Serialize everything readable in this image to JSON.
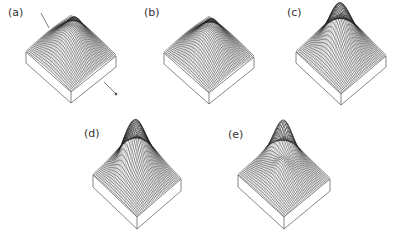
{
  "figure": {
    "panels": [
      {
        "id": "a",
        "label": "(a)",
        "label_pos": [
          8,
          6
        ],
        "center_x": 71,
        "top_y": 14,
        "half_width": 45,
        "depth": 38,
        "base_height": 11,
        "peaks": [
          [
            0.5,
            0.5,
            0.35,
            0.6
          ],
          [
            0.2,
            0.3,
            0.1,
            0.35
          ]
        ],
        "has_arrow": true
      },
      {
        "id": "b",
        "label": "(b)",
        "label_pos": [
          144,
          6
        ],
        "center_x": 209,
        "top_y": 15,
        "half_width": 45,
        "depth": 38,
        "base_height": 11,
        "peaks": [
          [
            0.5,
            0.5,
            0.35,
            0.6
          ],
          [
            0.22,
            0.3,
            0.1,
            0.3
          ]
        ],
        "has_arrow": false
      },
      {
        "id": "c",
        "label": "(c)",
        "label_pos": [
          287,
          6
        ],
        "center_x": 341,
        "top_y": 12,
        "half_width": 45,
        "depth": 40,
        "base_height": 11,
        "peaks": [
          [
            0.35,
            0.35,
            0.18,
            0.8
          ],
          [
            0.55,
            0.45,
            0.15,
            0.4
          ],
          [
            0.5,
            0.5,
            0.4,
            0.3
          ]
        ],
        "has_arrow": false
      },
      {
        "id": "d",
        "label": "(d)",
        "label_pos": [
          84,
          127
        ],
        "center_x": 137,
        "top_y": 135,
        "half_width": 44,
        "depth": 40,
        "base_height": 12,
        "peaks": [
          [
            0.3,
            0.3,
            0.2,
            0.9
          ],
          [
            0.45,
            0.45,
            0.12,
            0.5
          ],
          [
            0.6,
            0.35,
            0.1,
            0.45
          ],
          [
            0.5,
            0.5,
            0.4,
            0.3
          ]
        ],
        "has_arrow": false
      },
      {
        "id": "e",
        "label": "(e)",
        "label_pos": [
          228,
          128
        ],
        "center_x": 284,
        "top_y": 135,
        "half_width": 46,
        "depth": 40,
        "base_height": 12,
        "peaks": [
          [
            0.25,
            0.3,
            0.12,
            0.95
          ],
          [
            0.35,
            0.18,
            0.12,
            0.6
          ],
          [
            0.5,
            0.5,
            0.4,
            0.3
          ],
          [
            0.6,
            0.55,
            0.1,
            0.2
          ]
        ],
        "has_arrow": false
      }
    ],
    "mesh_color": "#222222",
    "box_color": "#555555"
  }
}
